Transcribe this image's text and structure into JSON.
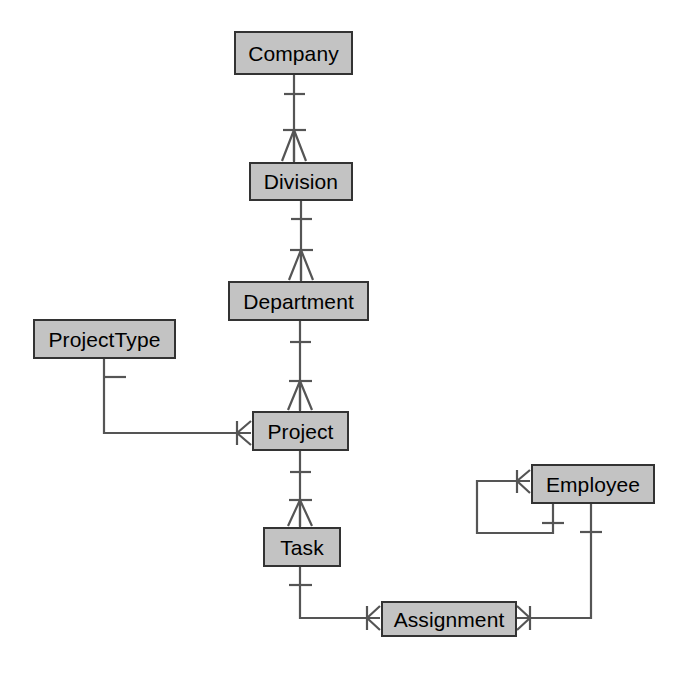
{
  "diagram": {
    "type": "entity-relationship-diagram",
    "notation": "crow's-foot",
    "title": "",
    "colors": {
      "entity_fill": "#c3c3c3",
      "entity_border": "#333333",
      "line": "#555555",
      "text": "#000000",
      "background": "#ffffff"
    },
    "entities": [
      {
        "id": "company",
        "label": "Company",
        "x": 234,
        "y": 31,
        "w": 119,
        "h": 44
      },
      {
        "id": "division",
        "label": "Division",
        "x": 249,
        "y": 162,
        "w": 104,
        "h": 39
      },
      {
        "id": "department",
        "label": "Department",
        "x": 228,
        "y": 281,
        "w": 141,
        "h": 40
      },
      {
        "id": "projecttype",
        "label": "ProjectType",
        "x": 33,
        "y": 319,
        "w": 143,
        "h": 40
      },
      {
        "id": "project",
        "label": "Project",
        "x": 252,
        "y": 411,
        "w": 97,
        "h": 40
      },
      {
        "id": "task",
        "label": "Task",
        "x": 263,
        "y": 527,
        "w": 78,
        "h": 40
      },
      {
        "id": "employee",
        "label": "Employee",
        "x": 531,
        "y": 464,
        "w": 124,
        "h": 40
      },
      {
        "id": "assignment",
        "label": "Assignment",
        "x": 381,
        "y": 601,
        "w": 136,
        "h": 36
      }
    ],
    "relationships": [
      {
        "id": "company-division",
        "from": "Company",
        "to": "Division",
        "from_cardinality": "one",
        "to_cardinality": "many"
      },
      {
        "id": "division-department",
        "from": "Division",
        "to": "Department",
        "from_cardinality": "one",
        "to_cardinality": "many"
      },
      {
        "id": "department-project",
        "from": "Department",
        "to": "Project",
        "from_cardinality": "one",
        "to_cardinality": "many"
      },
      {
        "id": "projecttype-project",
        "from": "ProjectType",
        "to": "Project",
        "from_cardinality": "one",
        "to_cardinality": "many"
      },
      {
        "id": "project-task",
        "from": "Project",
        "to": "Task",
        "from_cardinality": "one",
        "to_cardinality": "many"
      },
      {
        "id": "task-assignment",
        "from": "Task",
        "to": "Assignment",
        "from_cardinality": "one",
        "to_cardinality": "many"
      },
      {
        "id": "employee-assignment",
        "from": "Employee",
        "to": "Assignment",
        "from_cardinality": "one",
        "to_cardinality": "many"
      },
      {
        "id": "employee-employee",
        "from": "Employee",
        "to": "Employee",
        "from_cardinality": "one",
        "to_cardinality": "many"
      }
    ]
  }
}
